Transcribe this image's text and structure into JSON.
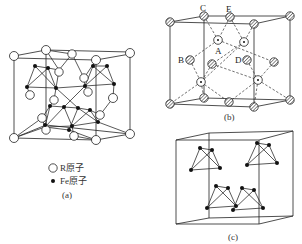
{
  "figure": {
    "panels": [
      {
        "id": "a",
        "caption": "(a)",
        "legend": [
          {
            "symbol": "open-circle",
            "label": "R原子"
          },
          {
            "symbol": "filled-dot",
            "label": "Fe原子"
          }
        ]
      },
      {
        "id": "b",
        "caption": "(b)",
        "site_labels": [
          "A",
          "B",
          "C",
          "D",
          "E"
        ]
      },
      {
        "id": "c",
        "caption": "(c)"
      }
    ]
  },
  "labels": {
    "a_caption": "(a)",
    "b_caption": "(b)",
    "c_caption": "(c)",
    "legend_r": "R原子",
    "legend_fe": "Fe原子",
    "site_A": "A",
    "site_B": "B",
    "site_C": "C",
    "site_D": "D",
    "site_E": "E"
  },
  "colors": {
    "line": "#222222",
    "background": "#ffffff",
    "fe_atom": "#111111",
    "r_atom_fill": "#ffffff"
  }
}
